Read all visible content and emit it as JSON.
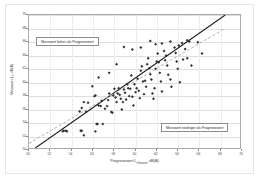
{
  "chart_data": {
    "type": "scatter",
    "title": "",
    "xlabel": "Prognosewert Lr,Strasse, dB(A)",
    "xlabel_main": "Prognosewert L",
    "xlabel_sub": "r,Strasse",
    "xlabel_unit": ", dB(A)",
    "ylabel": "Messwert Lr, dB(A)",
    "ylabel_main": "Messwert L",
    "ylabel_sub": "r",
    "ylabel_unit": ", dB(A)",
    "xlim": [
      50,
      70
    ],
    "ylim": [
      50,
      70
    ],
    "xticks": [
      50,
      52,
      54,
      56,
      58,
      60,
      62,
      64,
      66,
      68,
      70
    ],
    "yticks": [
      50,
      52,
      54,
      56,
      58,
      60,
      62,
      64,
      66,
      68,
      70
    ],
    "grid": true,
    "grid_color": "#dededf",
    "axis_color": "#a9a9a9",
    "point_color": "#333333",
    "point_marker": "diamond",
    "point_size": 1.5,
    "annotations": [
      {
        "id": "callout-above",
        "text": "Messwert höher als Prognosewert",
        "position": "upper-left"
      },
      {
        "id": "callout-below",
        "text": "Messwert niedriger als Prognosewert",
        "position": "lower-right"
      }
    ],
    "series": [
      {
        "name": "Messdaten",
        "type": "scatter",
        "points": [
          [
            53.2,
            52.5
          ],
          [
            53.3,
            52.6
          ],
          [
            53.5,
            52.6
          ],
          [
            53.6,
            52.5
          ],
          [
            54.9,
            52.6
          ],
          [
            55.0,
            52.6
          ],
          [
            55.2,
            51.9
          ],
          [
            56.3,
            52.5
          ],
          [
            56.4,
            53.6
          ],
          [
            56.5,
            53.6
          ],
          [
            57.0,
            53.6
          ],
          [
            54.8,
            55.5
          ],
          [
            55.0,
            56.0
          ],
          [
            55.2,
            56.9
          ],
          [
            55.4,
            55.4
          ],
          [
            55.6,
            56.8
          ],
          [
            56.0,
            59.3
          ],
          [
            56.2,
            57.8
          ],
          [
            56.3,
            57.9
          ],
          [
            56.6,
            56.4
          ],
          [
            56.8,
            56.3
          ],
          [
            56.9,
            57.1
          ],
          [
            57.2,
            55.9
          ],
          [
            57.4,
            56.3
          ],
          [
            57.5,
            57.2
          ],
          [
            57.6,
            58.2
          ],
          [
            57.8,
            55.4
          ],
          [
            57.9,
            55.3
          ],
          [
            58.0,
            57.9
          ],
          [
            58.1,
            58.9
          ],
          [
            58.2,
            57.6
          ],
          [
            58.3,
            56.9
          ],
          [
            58.4,
            58.2
          ],
          [
            58.5,
            59.0
          ],
          [
            58.6,
            58.0
          ],
          [
            58.7,
            57.4
          ],
          [
            58.8,
            55.8
          ],
          [
            58.9,
            56.9
          ],
          [
            59.0,
            58.8
          ],
          [
            59.1,
            58.3
          ],
          [
            59.2,
            57.3
          ],
          [
            59.3,
            59.6
          ],
          [
            59.4,
            59.0
          ],
          [
            59.5,
            57.8
          ],
          [
            59.6,
            58.9
          ],
          [
            59.7,
            60.9
          ],
          [
            59.8,
            57.7
          ],
          [
            59.9,
            56.4
          ],
          [
            60.0,
            59.6
          ],
          [
            60.1,
            58.4
          ],
          [
            60.2,
            59.0
          ],
          [
            60.3,
            60.4
          ],
          [
            60.4,
            58.6
          ],
          [
            60.5,
            57.5
          ],
          [
            60.6,
            61.6
          ],
          [
            60.7,
            62.3
          ],
          [
            60.8,
            60.0
          ],
          [
            60.9,
            58.1
          ],
          [
            61.0,
            60.1
          ],
          [
            61.1,
            59.2
          ],
          [
            61.2,
            62.6
          ],
          [
            61.3,
            63.5
          ],
          [
            61.4,
            62.0
          ],
          [
            61.5,
            61.1
          ],
          [
            61.6,
            60.3
          ],
          [
            61.7,
            58.2
          ],
          [
            61.8,
            57.4
          ],
          [
            61.9,
            59.0
          ],
          [
            62.0,
            61.9
          ],
          [
            62.1,
            63.0
          ],
          [
            62.2,
            64.2
          ],
          [
            62.3,
            62.9
          ],
          [
            62.4,
            61.3
          ],
          [
            62.5,
            60.0
          ],
          [
            62.6,
            58.5
          ],
          [
            62.8,
            64.6
          ],
          [
            62.9,
            63.2
          ],
          [
            63.0,
            63.9
          ],
          [
            63.1,
            62.4
          ],
          [
            63.2,
            61.0
          ],
          [
            63.4,
            60.3
          ],
          [
            63.5,
            59.2
          ],
          [
            63.8,
            65.1
          ],
          [
            63.9,
            64.3
          ],
          [
            64.0,
            63.0
          ],
          [
            64.1,
            61.9
          ],
          [
            64.3,
            59.9
          ],
          [
            64.5,
            65.8
          ],
          [
            64.6,
            63.3
          ],
          [
            64.8,
            64.9
          ],
          [
            65.0,
            63.5
          ],
          [
            65.2,
            66.0
          ],
          [
            65.4,
            62.4
          ],
          [
            66.0,
            65.9
          ],
          [
            66.4,
            64.2
          ],
          [
            61.5,
            66.1
          ],
          [
            59.0,
            65.2
          ],
          [
            62.6,
            65.7
          ],
          [
            63.4,
            66.0
          ],
          [
            64.2,
            65.4
          ],
          [
            65.0,
            66.2
          ],
          [
            57.6,
            61.3
          ],
          [
            58.3,
            62.6
          ],
          [
            56.6,
            60.6
          ],
          [
            59.8,
            64.8
          ],
          [
            60.6,
            65.1
          ],
          [
            62.0,
            65.6
          ]
        ]
      },
      {
        "name": "Regressionsgerade",
        "type": "line",
        "style": "solid",
        "color": "#1a1a1a",
        "width": 1.1,
        "x0": 50.6,
        "y0": 50.0,
        "x1": 68.6,
        "y1": 70.0
      },
      {
        "name": "Winkelhalbierende",
        "type": "line",
        "style": "dashed",
        "color": "#b4b4b4",
        "width": 1.0,
        "x0": 50.0,
        "y0": 50.7,
        "x1": 68.6,
        "y1": 68.0
      }
    ]
  }
}
